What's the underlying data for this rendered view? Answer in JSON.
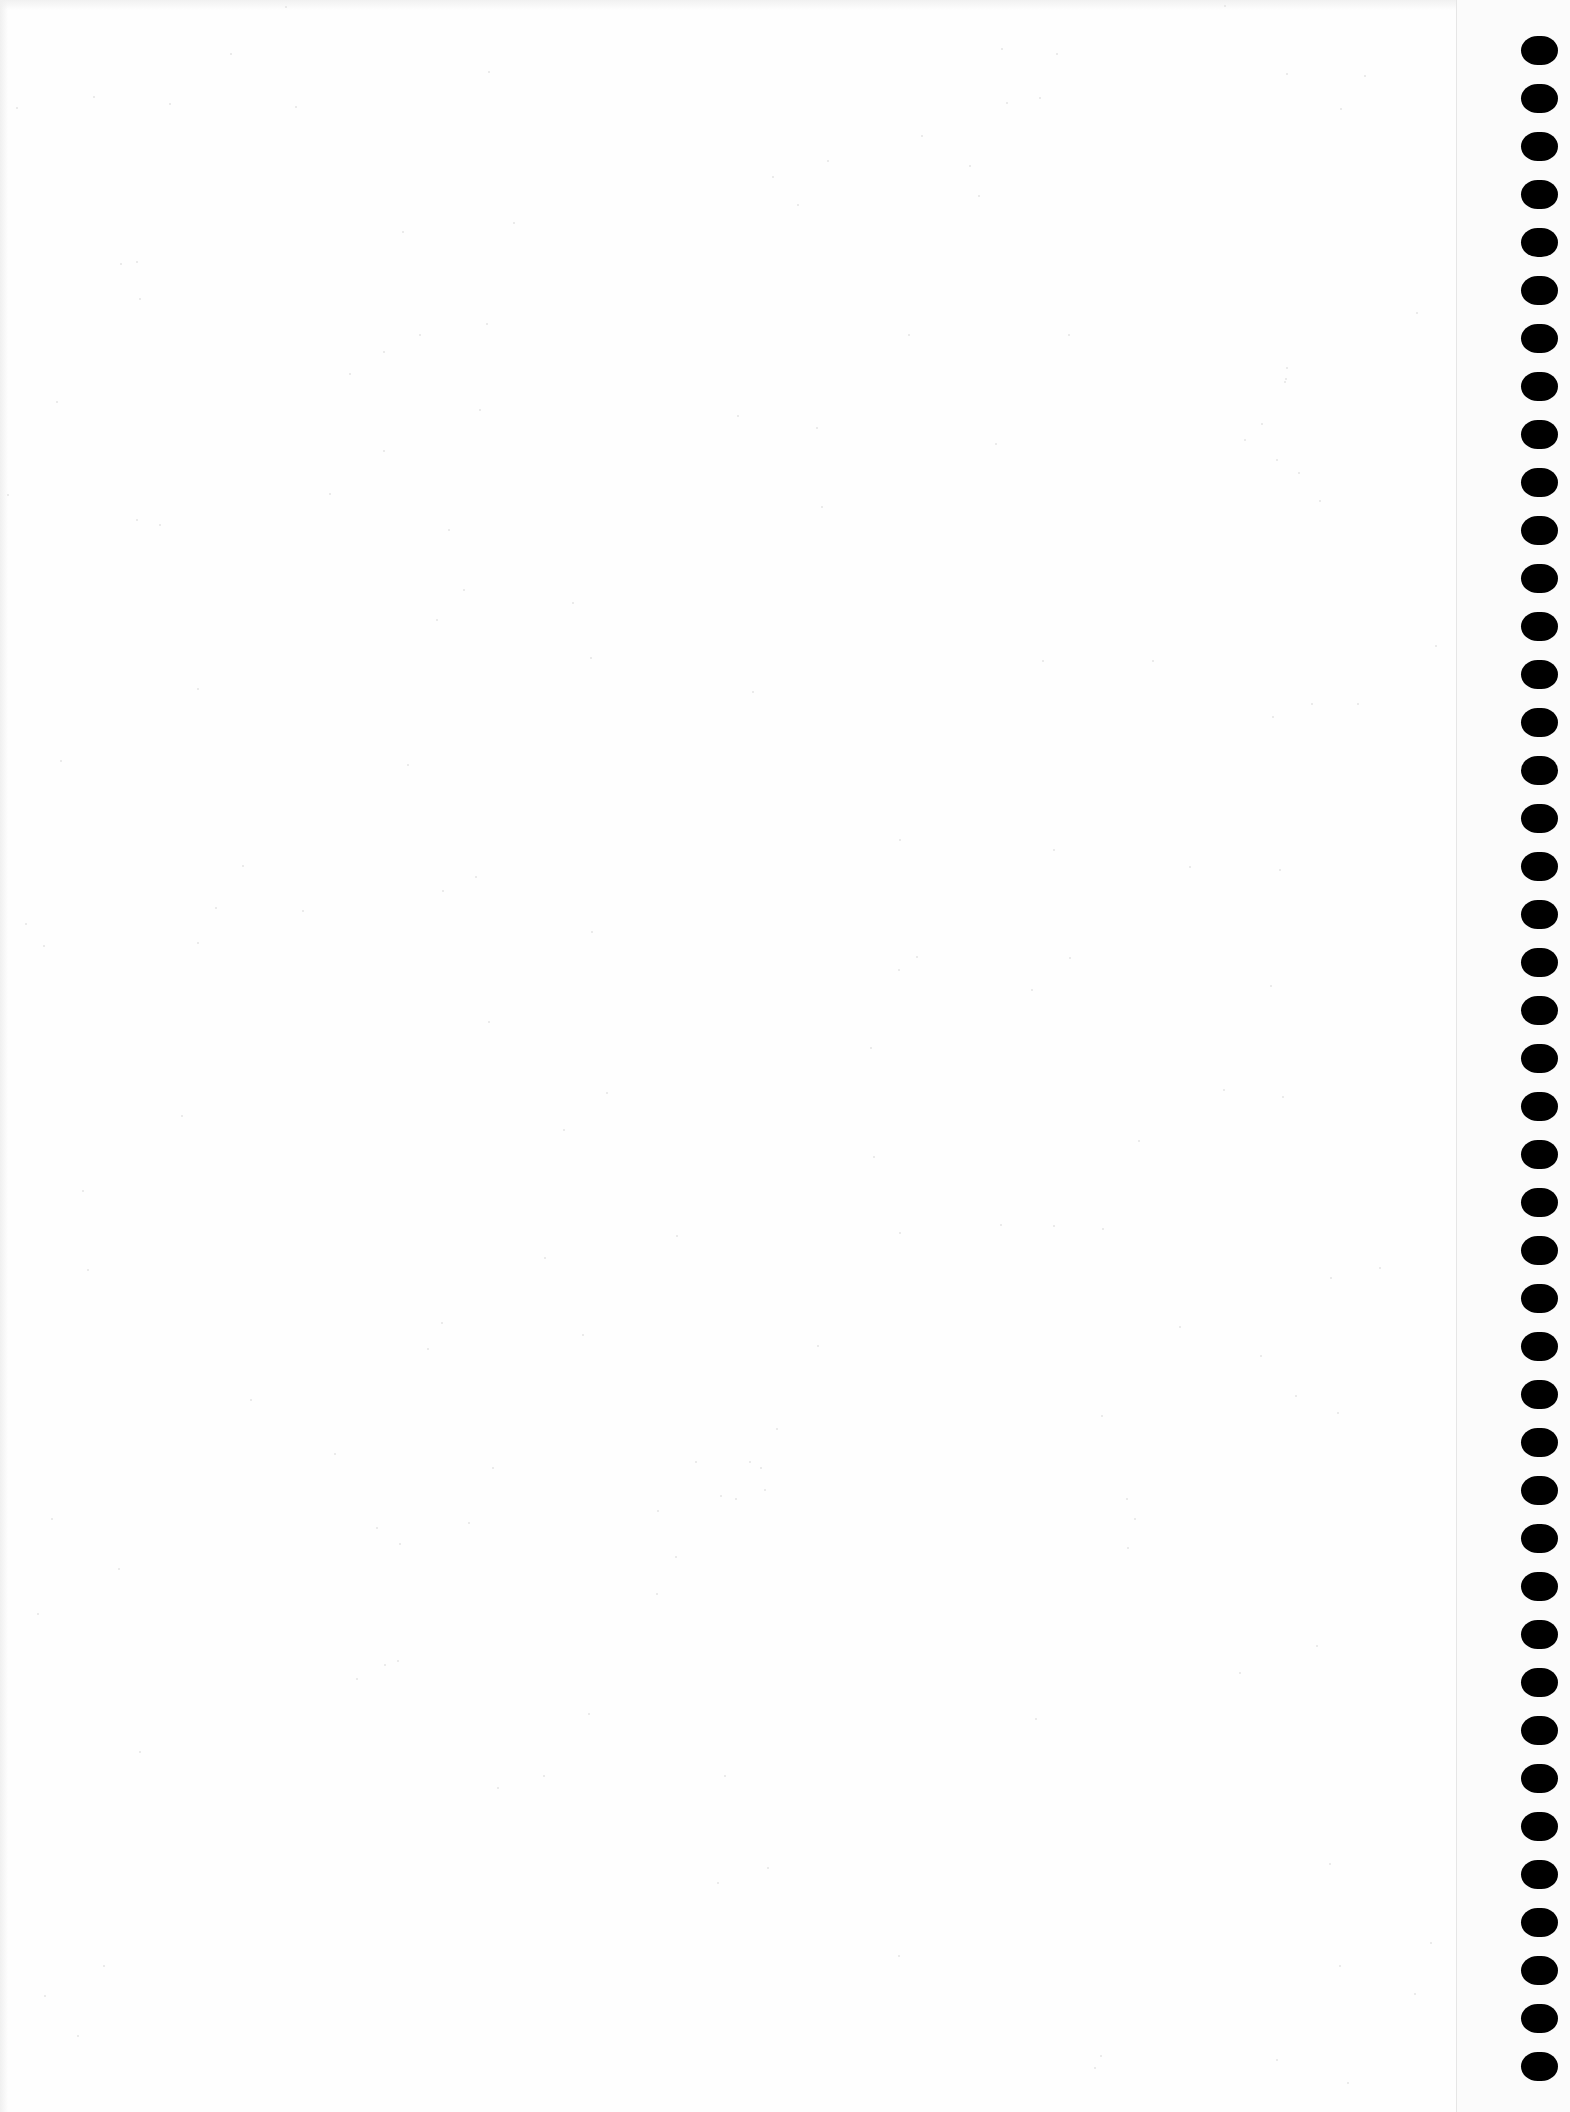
{
  "document": {
    "type": "blank scanned sheet",
    "content_text": "",
    "background_color": "#fefefe",
    "perforation": {
      "side": "right",
      "hole_count": 43,
      "hole_color": "#000000",
      "first_hole_center_y": 50,
      "hole_pitch_px": 48,
      "hole_width_px": 37,
      "hole_height_px": 29,
      "guide_line_x": 1456,
      "guide_line_color": "#e6e6e6"
    }
  }
}
